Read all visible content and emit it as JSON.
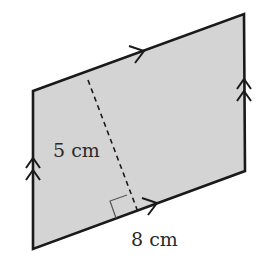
{
  "figure": {
    "shape": "parallelogram",
    "fill_color": "#d4d4d4",
    "stroke_color": "#1a1a1a",
    "vertices": {
      "top_left": [
        33,
        91
      ],
      "top_right": [
        244,
        14
      ],
      "bottom_right": [
        245,
        171
      ],
      "bottom_left": [
        33,
        249
      ]
    },
    "height_label": "5 cm",
    "base_label": "8 cm",
    "height_line": {
      "style": "dashed",
      "from": [
        88,
        80
      ],
      "to": [
        138,
        212
      ]
    },
    "right_angle_marker": true,
    "parallel_markers": {
      "horizontal_sides": "single arrow",
      "vertical_sides": "double arrow"
    }
  }
}
